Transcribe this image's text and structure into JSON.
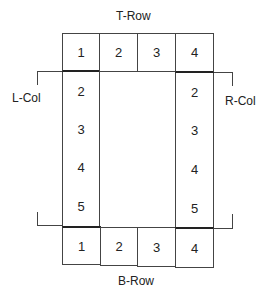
{
  "labels": {
    "top_row": "T-Row",
    "bottom_row": "B-Row",
    "left_col": "L-Col",
    "right_col": "R-Col"
  },
  "top_row": [
    "1",
    "2",
    "3",
    "4"
  ],
  "bottom_row": [
    "1",
    "2",
    "3",
    "4"
  ],
  "left_col": [
    "2",
    "3",
    "4",
    "5"
  ],
  "right_col": [
    "2",
    "3",
    "4",
    "5"
  ],
  "colors": {
    "line": "#444444",
    "text": "#222222",
    "background": "#ffffff"
  }
}
